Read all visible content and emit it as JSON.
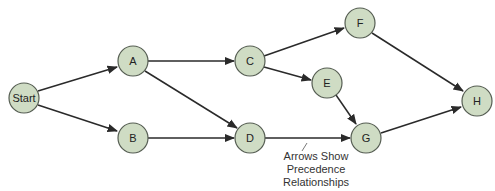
{
  "diagram": {
    "type": "precedence-network",
    "node_color": "#cfdcc4",
    "edge_color": "#2a2a2a",
    "nodes": [
      {
        "id": "start",
        "label": "Start",
        "x": 24,
        "y": 98
      },
      {
        "id": "A",
        "label": "A",
        "x": 133,
        "y": 61
      },
      {
        "id": "B",
        "label": "B",
        "x": 133,
        "y": 138
      },
      {
        "id": "C",
        "label": "C",
        "x": 250,
        "y": 61
      },
      {
        "id": "D",
        "label": "D",
        "x": 250,
        "y": 138
      },
      {
        "id": "E",
        "label": "E",
        "x": 327,
        "y": 83
      },
      {
        "id": "F",
        "label": "F",
        "x": 360,
        "y": 23
      },
      {
        "id": "G",
        "label": "G",
        "x": 366,
        "y": 138
      },
      {
        "id": "H",
        "label": "H",
        "x": 477,
        "y": 101
      }
    ],
    "edges": [
      {
        "from": "Start",
        "to": "A"
      },
      {
        "from": "Start",
        "to": "B"
      },
      {
        "from": "A",
        "to": "C"
      },
      {
        "from": "A",
        "to": "D"
      },
      {
        "from": "B",
        "to": "D"
      },
      {
        "from": "C",
        "to": "F"
      },
      {
        "from": "C",
        "to": "E"
      },
      {
        "from": "E",
        "to": "G"
      },
      {
        "from": "D",
        "to": "G"
      },
      {
        "from": "F",
        "to": "H"
      },
      {
        "from": "G",
        "to": "H"
      }
    ],
    "annotation": {
      "lines": [
        "Arrows Show",
        "Precedence",
        "Relationships"
      ]
    }
  }
}
